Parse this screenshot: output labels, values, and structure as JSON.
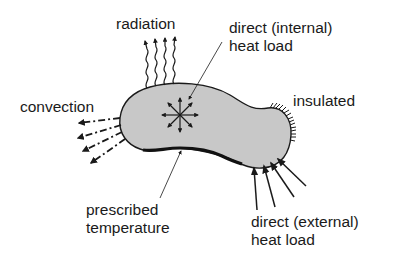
{
  "diagram": {
    "type": "heat transfer boundary conditions schematic",
    "body": {
      "fill": "#c8c8c8",
      "stroke": "#1a1a1a"
    },
    "labels": {
      "radiation": "radiation",
      "internal_line1": "direct (internal)",
      "internal_line2": "heat load",
      "convection": "convection",
      "insulated": "insulated",
      "prescribed_line1": "prescribed",
      "prescribed_line2": "temperature",
      "external_line1": "direct (external)",
      "external_line2": "heat load"
    },
    "boundary_conditions": [
      {
        "name": "radiation",
        "symbol": "wavy-arrows",
        "count": 4
      },
      {
        "name": "direct internal heat load",
        "symbol": "radial-arrows",
        "count": 8
      },
      {
        "name": "convection",
        "symbol": "dash-dot-arrows",
        "count": 4
      },
      {
        "name": "insulated",
        "symbol": "hatched-edge"
      },
      {
        "name": "prescribed temperature",
        "symbol": "thick-edge"
      },
      {
        "name": "direct external heat load",
        "symbol": "straight-arrows",
        "count": 4
      }
    ]
  }
}
